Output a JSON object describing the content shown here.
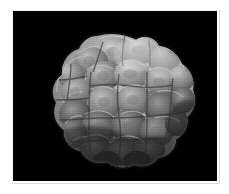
{
  "figure": {
    "kind": "sem-micrograph",
    "background_color": "#000000",
    "page_color": "#ffffff",
    "caption": "",
    "scale_bar_label": "",
    "annotation_text": ""
  },
  "plate": {
    "left": 13,
    "top": 11,
    "width": 204,
    "height": 170
  },
  "specimen": {
    "name": "lobed-microfossil",
    "description": "Rounded mulberry-like body with many bulbous polygonal lobes, bright raised rims and dark grooves between lobes.",
    "highlight_color": "#d7d7d7",
    "midtone_color": "#9a9a9a",
    "shadow_color": "#2c2c2c",
    "rim_color": "#e8e8e8",
    "lobe_count": 24
  },
  "lighting": {
    "direction": "upper-right",
    "brightest_region": "top-center-right",
    "darkest_region": "lower-left-and-bottom"
  }
}
